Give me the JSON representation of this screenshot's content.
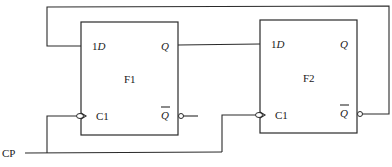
{
  "diagram": {
    "type": "circuit",
    "title": "",
    "flip_flops": [
      {
        "name": "F1",
        "inputs": {
          "d_label_prefix": "1",
          "d_label": "D",
          "clock_label": "C1"
        },
        "outputs": {
          "q_label": "Q",
          "qbar_label": "Q"
        }
      },
      {
        "name": "F2",
        "inputs": {
          "d_label_prefix": "1",
          "d_label": "D",
          "clock_label": "C1"
        },
        "outputs": {
          "q_label": "Q",
          "qbar_label": "Q"
        }
      }
    ],
    "clock_input": {
      "label": "CP"
    },
    "connections": [
      {
        "from": "F1.Q",
        "to": "F2.1D"
      },
      {
        "from": "F2.Qbar",
        "to": "F1.1D"
      },
      {
        "from": "CP",
        "to": "F1.C1"
      },
      {
        "from": "CP",
        "to": "F2.C1"
      }
    ],
    "colors": {
      "line": "#2a2a2a",
      "background": "#ffffff"
    }
  }
}
